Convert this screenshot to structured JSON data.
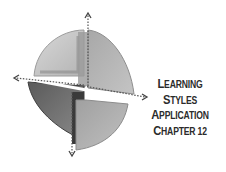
{
  "title": {
    "lines": [
      {
        "first": "L",
        "rest": "EARNING"
      },
      {
        "first": "S",
        "rest": "TYLES"
      },
      {
        "first": "A",
        "rest": "PPLICATION"
      },
      {
        "first": "C",
        "rest": "HAPTER 12"
      }
    ]
  },
  "graphic": {
    "description": "3D disc divided into four quadrants with dotted directional arrows",
    "arrows": [
      "up",
      "left",
      "right",
      "down"
    ],
    "colors": {
      "light": "#c8c8c8",
      "mid": "#9a9a9a",
      "dark": "#4a4a4a",
      "text": "#2b2b2b"
    }
  }
}
